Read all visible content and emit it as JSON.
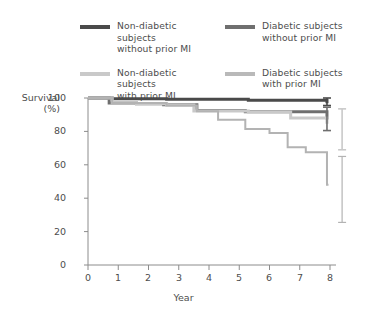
{
  "chart_data": {
    "type": "line",
    "subtype": "kaplan-meier-step",
    "title": "",
    "xlabel": "Year",
    "ylabel": "Survival (%)",
    "xlim": [
      0,
      8
    ],
    "ylim": [
      0,
      100
    ],
    "xticks": [
      0,
      1,
      2,
      3,
      4,
      5,
      6,
      7,
      8
    ],
    "yticks": [
      0,
      20,
      40,
      60,
      80,
      100
    ],
    "grid": false,
    "legend_position": "top",
    "series": [
      {
        "name": "Non-diabetic subjects without prior MI",
        "color": "#4a4a4a",
        "line_width": 3,
        "steps_x": [
          0,
          0.8,
          2.6,
          5.3,
          7.9
        ],
        "steps_y": [
          100,
          99.6,
          99.2,
          98.6,
          97.8
        ],
        "endpoint_value": 97.8,
        "error_bar": {
          "at_x": 7.9,
          "low": 95.5,
          "high": 100.0
        }
      },
      {
        "name": "Diabetic subjects without prior MI",
        "color": "#6f6f6f",
        "line_width": 3,
        "steps_x": [
          0,
          0.7,
          1.6,
          2.5,
          3.6,
          5.2,
          7.9
        ],
        "steps_y": [
          100,
          97.0,
          96.6,
          96.0,
          92.5,
          91.8,
          88.0
        ],
        "endpoint_value": 88.0,
        "error_bar": {
          "at_x": 7.9,
          "low": 80.5,
          "high": 94.5
        }
      },
      {
        "name": "Non-diabetic subjects with prior MI",
        "color": "#c9c9c9",
        "line_width": 3,
        "steps_x": [
          0,
          0.8,
          1.6,
          2.6,
          3.5,
          5.3,
          6.7,
          7.9
        ],
        "steps_y": [
          100,
          97.2,
          96.6,
          95.8,
          92.2,
          91.6,
          88.0,
          85.5
        ],
        "endpoint_value": 85.5,
        "error_bar": {
          "at_x": 8.4,
          "low": 69.0,
          "high": 93.5
        }
      },
      {
        "name": "Diabetic subjects with prior MI",
        "color": "#b3b3b3",
        "line_width": 2,
        "steps_x": [
          0,
          0.8,
          2.6,
          3.6,
          4.3,
          5.2,
          6.0,
          6.6,
          7.2,
          7.9
        ],
        "steps_y": [
          100,
          97.0,
          95.5,
          92.0,
          87.0,
          81.5,
          79.0,
          70.5,
          67.5,
          48.0
        ],
        "endpoint_value": 48.0,
        "error_bar": {
          "at_x": 8.4,
          "low": 25.5,
          "high": 65.0
        }
      }
    ]
  },
  "legend": {
    "items": [
      {
        "id": "non-diabetic-without-mi",
        "label": "Non-diabetic subjects\nwithout prior MI",
        "color": "#4a4a4a"
      },
      {
        "id": "diabetic-without-mi",
        "label": "Diabetic subjects\nwithout prior MI",
        "color": "#6f6f6f"
      },
      {
        "id": "non-diabetic-with-mi",
        "label": "Non-diabetic subjects\nwith prior MI",
        "color": "#c9c9c9"
      },
      {
        "id": "diabetic-with-mi",
        "label": "Diabetic subjects\nwith prior MI",
        "color": "#b9b9b9"
      }
    ]
  },
  "axes": {
    "y_title": "Survival\n(%)",
    "x_title": "Year",
    "y_tick_labels": [
      "100",
      "80",
      "60",
      "40",
      "20",
      "0"
    ],
    "x_tick_labels": [
      "0",
      "1",
      "2",
      "3",
      "4",
      "5",
      "6",
      "7",
      "8"
    ]
  },
  "colors": {
    "axis": "#8c8c8c",
    "text": "#4d4d4d",
    "background": "#ffffff"
  }
}
